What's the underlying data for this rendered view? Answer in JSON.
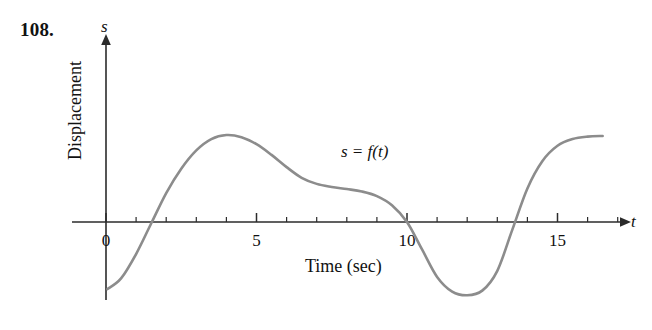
{
  "figure": {
    "problem_number": "108.",
    "curve_label": "s = f(t)",
    "y_axis_symbol": "s",
    "x_axis_symbol": "t",
    "y_axis_title": "Displacement",
    "x_axis_title": "Time (sec)",
    "curve_color": "#8c8c8c",
    "axis_color": "#2b2b2b",
    "background_color": "#ffffff"
  },
  "chart_data": {
    "type": "line",
    "title": "",
    "xlabel": "Time (sec)",
    "ylabel": "Displacement",
    "x_symbol": "t",
    "y_symbol": "s",
    "annotations": [
      "s = f(t)"
    ],
    "grid": false,
    "legend": "none",
    "xlim": [
      0,
      17.2
    ],
    "ylim": [
      -3.2,
      3.2
    ],
    "x_major_ticks": [
      0,
      5,
      10,
      15
    ],
    "x_major_tick_labels": [
      "0",
      "5",
      "10",
      "15"
    ],
    "x_minor_tick_step": 1,
    "y_ticks": [],
    "x": [
      0.05,
      0.5,
      1.0,
      1.5,
      2.0,
      2.5,
      3.0,
      3.5,
      4.0,
      4.5,
      5.0,
      5.5,
      6.0,
      6.5,
      7.0,
      7.5,
      8.0,
      8.5,
      9.0,
      9.5,
      10.0,
      10.5,
      11.0,
      11.5,
      12.0,
      12.5,
      13.0,
      13.5,
      14.0,
      14.5,
      15.0,
      15.5,
      16.0,
      16.5
    ],
    "y": [
      -2.2,
      -1.85,
      -1.05,
      -0.05,
      0.95,
      1.75,
      2.35,
      2.72,
      2.85,
      2.78,
      2.55,
      2.2,
      1.8,
      1.45,
      1.25,
      1.15,
      1.08,
      1.0,
      0.85,
      0.55,
      0.0,
      -0.9,
      -1.8,
      -2.28,
      -2.4,
      -2.25,
      -1.6,
      -0.25,
      1.1,
      2.0,
      2.5,
      2.72,
      2.8,
      2.82
    ],
    "notes": {
      "zero_crossings": [
        1.55,
        10.0,
        13.55
      ],
      "local_max": {
        "t": 4.0,
        "s": 2.85
      },
      "local_min": {
        "t": 12.1,
        "s": -2.4
      },
      "shelf_interval": [
        7.0,
        9.0
      ],
      "curve_start": {
        "t": 0.05,
        "s": -2.2
      },
      "curve_end": {
        "t": 16.5,
        "s": 2.82
      }
    }
  }
}
